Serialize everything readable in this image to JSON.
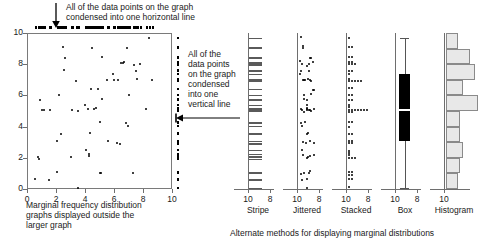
{
  "annotations": {
    "top_note": "All of the data points on the graph\ncondensed into one horizontal line",
    "right_note": "All of the\ndata points\non the graph\ncondensed\ninto one\nvertical line",
    "left_caption": "Marginal frequency distribution\ngraphs displayed outside the\nlarger graph",
    "bottom_caption": "Alternate methods for displaying marginal distributions"
  },
  "main_axis": {
    "y_ticks": [
      "0",
      "2",
      "4",
      "6",
      "8",
      "10"
    ],
    "x_ticks": [
      "0",
      "2",
      "4",
      "6",
      "8",
      "10"
    ],
    "xlim": [
      0,
      10
    ],
    "ylim": [
      0,
      10
    ]
  },
  "panels": [
    {
      "name": "stripe",
      "label": "Stripe",
      "left_tick": "10",
      "right_tick": "8"
    },
    {
      "name": "jittered",
      "label": "Jittered",
      "left_tick": "10",
      "right_tick": "8"
    },
    {
      "name": "stacked",
      "label": "Stacked",
      "left_tick": "10",
      "right_tick": "8"
    },
    {
      "name": "box",
      "label": "Box",
      "left_tick": "10",
      "right_tick": "8"
    },
    {
      "name": "histogram",
      "label": "Histogram",
      "left_tick": "10",
      "right_tick": ""
    }
  ],
  "colors": {
    "ink": "#000000",
    "axis": "#6e6e6e",
    "frame": "#7a7a7a",
    "bar_fill": "#e8e8e8",
    "bar_stroke": "#8a8a8a",
    "box_fill": "#000000",
    "stripe": "#5a5a5a"
  },
  "chart_data": {
    "type": "scatter",
    "title": "",
    "xlabel": "",
    "ylabel": "",
    "xlim": [
      0,
      10
    ],
    "ylim": [
      0,
      10
    ],
    "grid": false,
    "legend": false,
    "points": [
      [
        0.55,
        0.62
      ],
      [
        0.75,
        2.05
      ],
      [
        0.85,
        1.95
      ],
      [
        0.9,
        5.7
      ],
      [
        1.0,
        5.05
      ],
      [
        1.15,
        5.05
      ],
      [
        1.55,
        0.55
      ],
      [
        1.6,
        5.05
      ],
      [
        2.05,
        1.1
      ],
      [
        2.1,
        3.05
      ],
      [
        2.2,
        6.05
      ],
      [
        2.35,
        3.5
      ],
      [
        2.45,
        9.1
      ],
      [
        2.55,
        7.6
      ],
      [
        2.6,
        8.4
      ],
      [
        3.0,
        2.05
      ],
      [
        3.1,
        5.05
      ],
      [
        3.35,
        6.95
      ],
      [
        3.5,
        0.08
      ],
      [
        3.55,
        5.0
      ],
      [
        4.0,
        5.4
      ],
      [
        4.1,
        2.5
      ],
      [
        4.2,
        5.1
      ],
      [
        4.25,
        2.1
      ],
      [
        4.3,
        2.25
      ],
      [
        4.35,
        3.6
      ],
      [
        4.4,
        6.4
      ],
      [
        4.5,
        9.05
      ],
      [
        4.6,
        5.1
      ],
      [
        4.75,
        5.2
      ],
      [
        4.9,
        6.4
      ],
      [
        5.0,
        1.0
      ],
      [
        5.05,
        4.3
      ],
      [
        5.1,
        1.0
      ],
      [
        5.15,
        8.45
      ],
      [
        5.2,
        5.75
      ],
      [
        5.5,
        7.0
      ],
      [
        5.6,
        3.05
      ],
      [
        5.9,
        7.35
      ],
      [
        6.0,
        7.0
      ],
      [
        6.2,
        2.95
      ],
      [
        6.3,
        7.0
      ],
      [
        6.4,
        2.9
      ],
      [
        6.5,
        8.1
      ],
      [
        6.6,
        8.05
      ],
      [
        6.7,
        8.15
      ],
      [
        6.8,
        4.25
      ],
      [
        6.9,
        9.05
      ],
      [
        6.95,
        4.05
      ],
      [
        7.0,
        6.05
      ],
      [
        7.3,
        1.05
      ],
      [
        7.35,
        7.95
      ],
      [
        7.5,
        7.55
      ],
      [
        7.6,
        7.05
      ],
      [
        7.8,
        8.0
      ],
      [
        8.2,
        5.1
      ],
      [
        8.4,
        9.7
      ],
      [
        8.6,
        7.0
      ]
    ],
    "top_marginal": {
      "type": "rug",
      "axis": "x",
      "values": [
        0.55,
        0.75,
        0.85,
        0.9,
        1.0,
        1.15,
        1.55,
        1.6,
        2.05,
        2.1,
        2.2,
        2.35,
        2.45,
        2.55,
        2.6,
        3.0,
        3.1,
        3.35,
        3.5,
        3.55,
        4.0,
        4.1,
        4.2,
        4.25,
        4.3,
        4.35,
        4.4,
        4.5,
        4.6,
        4.75,
        4.9,
        5.0,
        5.05,
        5.1,
        5.15,
        5.2,
        5.5,
        5.6,
        5.9,
        6.0,
        6.2,
        6.3,
        6.4,
        6.5,
        6.6,
        6.7,
        6.8,
        6.9,
        6.95,
        7.0,
        7.3,
        7.35,
        7.5,
        7.6,
        7.8,
        8.2,
        8.4,
        8.6
      ]
    },
    "right_marginal": {
      "type": "rug",
      "axis": "y",
      "values": [
        0.08,
        0.55,
        0.62,
        1.0,
        1.0,
        1.05,
        1.1,
        1.95,
        2.05,
        2.05,
        2.1,
        2.25,
        2.5,
        2.9,
        2.95,
        3.05,
        3.05,
        3.5,
        3.6,
        4.05,
        4.25,
        4.3,
        5.0,
        5.0,
        5.05,
        5.05,
        5.05,
        5.05,
        5.1,
        5.1,
        5.1,
        5.2,
        5.4,
        5.7,
        5.75,
        6.05,
        6.05,
        6.4,
        6.4,
        6.95,
        7.0,
        7.0,
        7.0,
        7.0,
        7.05,
        7.35,
        7.55,
        7.6,
        7.95,
        8.0,
        8.05,
        8.1,
        8.15,
        8.4,
        8.45,
        9.05,
        9.1,
        9.7
      ]
    },
    "marginal_variable": "y",
    "marginal_values": [
      0.08,
      0.55,
      0.62,
      1.0,
      1.0,
      1.05,
      1.1,
      1.95,
      2.05,
      2.05,
      2.1,
      2.25,
      2.5,
      2.9,
      2.95,
      3.05,
      3.05,
      3.5,
      3.6,
      4.05,
      4.25,
      4.3,
      5.0,
      5.0,
      5.05,
      5.05,
      5.05,
      5.05,
      5.1,
      5.1,
      5.1,
      5.2,
      5.4,
      5.7,
      5.75,
      6.05,
      6.05,
      6.4,
      6.4,
      6.95,
      7.0,
      7.0,
      7.0,
      7.0,
      7.05,
      7.35,
      7.55,
      7.6,
      7.95,
      8.0,
      8.05,
      8.1,
      8.15,
      8.4,
      8.45,
      9.05,
      9.1,
      9.7
    ],
    "box_stats": {
      "min": 0.08,
      "q1": 3.05,
      "median": 5.1,
      "q3": 7.35,
      "max": 9.7
    },
    "histogram": {
      "bin_edges": [
        0,
        1,
        2,
        3,
        4,
        5,
        6,
        7,
        8,
        9,
        10
      ],
      "counts": [
        3,
        4,
        5,
        4,
        4,
        11,
        5,
        10,
        8,
        3
      ],
      "orientation": "horizontal"
    }
  }
}
